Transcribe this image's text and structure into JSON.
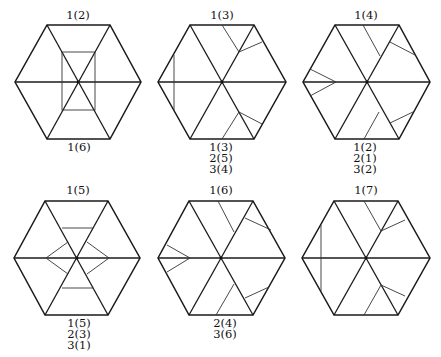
{
  "figure": {
    "panels": [
      {
        "id": "p1",
        "top_label": "1(2)",
        "bottom_labels": [
          "1(6)"
        ]
      },
      {
        "id": "p2",
        "top_label": "1(3)",
        "bottom_labels": [
          "1(3)",
          "2(5)",
          "3(4)"
        ]
      },
      {
        "id": "p3",
        "top_label": "1(4)",
        "bottom_labels": [
          "1(2)",
          "2(1)",
          "3(2)"
        ]
      },
      {
        "id": "p4",
        "top_label": "1(5)",
        "bottom_labels": [
          "1(5)",
          "2(3)",
          "3(1)"
        ]
      },
      {
        "id": "p5",
        "top_label": "1(6)",
        "bottom_labels": [
          "2(4)",
          "3(6)"
        ]
      },
      {
        "id": "p6",
        "top_label": "1(7)",
        "bottom_labels": []
      }
    ]
  },
  "colors": {
    "stroke": "#1a1a1a",
    "fold_stroke": "#333333",
    "background": "#ffffff"
  }
}
